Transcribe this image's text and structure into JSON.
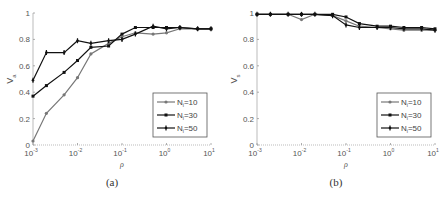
{
  "chart_data": [
    {
      "type": "line",
      "panel": "a",
      "caption": "(a)",
      "title": "",
      "xlabel": "ρ",
      "ylabel": "V_a",
      "xscale": "log",
      "xlim": [
        0.001,
        10
      ],
      "ylim": [
        0,
        1
      ],
      "yticks": [
        0,
        0.2,
        0.4,
        0.6,
        0.8,
        1
      ],
      "ytick_labels": [
        "0",
        "0.2",
        "0.4",
        "0.6",
        "0.8",
        "1"
      ],
      "xticks": [
        0.001,
        0.01,
        0.1,
        1,
        10
      ],
      "xtick_labels": [
        [
          "10",
          "-3"
        ],
        [
          "10",
          "-2"
        ],
        [
          "10",
          "-1"
        ],
        [
          "10",
          "0"
        ],
        [
          "10",
          "1"
        ]
      ],
      "grid": false,
      "legend_position": "lower right",
      "x": [
        0.001,
        0.002,
        0.005,
        0.01,
        0.02,
        0.05,
        0.1,
        0.2,
        0.5,
        1,
        2,
        5,
        10
      ],
      "series": [
        {
          "name": "N_i=10",
          "label_main": "N",
          "label_sub": "i",
          "label_rest": "=10",
          "color": "#777777",
          "marker": "circle",
          "values": [
            0.03,
            0.24,
            0.38,
            0.51,
            0.69,
            0.77,
            0.82,
            0.85,
            0.84,
            0.85,
            0.88,
            0.88,
            0.88
          ]
        },
        {
          "name": "N_i=30",
          "label_main": "N",
          "label_sub": "i",
          "label_rest": "=30",
          "color": "#111111",
          "marker": "square",
          "values": [
            0.37,
            0.45,
            0.55,
            0.64,
            0.74,
            0.75,
            0.84,
            0.89,
            0.89,
            0.89,
            0.89,
            0.88,
            0.88
          ]
        },
        {
          "name": "N_i=50",
          "label_main": "N",
          "label_sub": "i",
          "label_rest": "=50",
          "color": "#111111",
          "marker": "plus",
          "values": [
            0.49,
            0.7,
            0.7,
            0.79,
            0.77,
            0.79,
            0.8,
            0.84,
            0.9,
            0.88,
            0.89,
            0.88,
            0.88
          ]
        }
      ]
    },
    {
      "type": "line",
      "panel": "b",
      "caption": "(b)",
      "title": "",
      "xlabel": "ρ",
      "ylabel": "V_s",
      "xscale": "log",
      "xlim": [
        0.001,
        10
      ],
      "ylim": [
        0,
        1
      ],
      "yticks": [
        0,
        0.2,
        0.4,
        0.6,
        0.8,
        1
      ],
      "ytick_labels": [
        "0",
        "0.2",
        "0.4",
        "0.6",
        "0.8",
        "1"
      ],
      "xticks": [
        0.001,
        0.01,
        0.1,
        1,
        10
      ],
      "xtick_labels": [
        [
          "10",
          "-3"
        ],
        [
          "10",
          "-2"
        ],
        [
          "10",
          "-1"
        ],
        [
          "10",
          "0"
        ],
        [
          "10",
          "1"
        ]
      ],
      "grid": false,
      "legend_position": "lower right",
      "x": [
        0.001,
        0.002,
        0.005,
        0.01,
        0.02,
        0.05,
        0.1,
        0.2,
        0.5,
        1,
        2,
        5,
        10
      ],
      "series": [
        {
          "name": "N_i=10",
          "label_main": "N",
          "label_sub": "i",
          "label_rest": "=10",
          "color": "#777777",
          "marker": "circle",
          "values": [
            0.99,
            0.99,
            0.99,
            0.95,
            0.99,
            0.98,
            0.94,
            0.9,
            0.89,
            0.88,
            0.87,
            0.87,
            0.87
          ]
        },
        {
          "name": "N_i=30",
          "label_main": "N",
          "label_sub": "i",
          "label_rest": "=30",
          "color": "#111111",
          "marker": "square",
          "values": [
            0.99,
            0.99,
            0.99,
            0.99,
            0.99,
            0.99,
            0.97,
            0.92,
            0.9,
            0.9,
            0.89,
            0.89,
            0.88
          ]
        },
        {
          "name": "N_i=50",
          "label_main": "N",
          "label_sub": "i",
          "label_rest": "=50",
          "color": "#111111",
          "marker": "plus",
          "values": [
            0.99,
            0.99,
            0.99,
            0.99,
            0.99,
            0.98,
            0.91,
            0.89,
            0.89,
            0.89,
            0.88,
            0.88,
            0.87
          ]
        }
      ]
    }
  ]
}
